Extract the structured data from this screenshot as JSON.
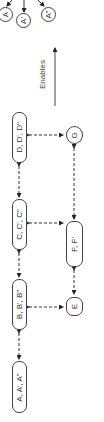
{
  "diagram": {
    "orientation": "rotated-90-ccw",
    "legend": {
      "label": "Enables",
      "arrow": "solid-arrow"
    },
    "top_nodes": [
      {
        "id": "A",
        "label": "A"
      },
      {
        "id": "A1",
        "label": "A'"
      },
      {
        "id": "A2",
        "label": "A\""
      }
    ],
    "main_chain": [
      {
        "id": "D",
        "label": "D, D', D\""
      },
      {
        "id": "C",
        "label": "C, C', C\""
      },
      {
        "id": "B",
        "label": "B, B', B\""
      },
      {
        "id": "Agroup",
        "label": "A, A', A\""
      }
    ],
    "side_nodes": [
      {
        "id": "G",
        "label": "G"
      },
      {
        "id": "F",
        "label": "F, F'"
      },
      {
        "id": "E",
        "label": "E"
      }
    ],
    "edges": [
      {
        "from": "Agroup",
        "to": "B",
        "style": "dashed",
        "bidirectional": true
      },
      {
        "from": "B",
        "to": "C",
        "style": "dashed",
        "bidirectional": true
      },
      {
        "from": "C",
        "to": "D",
        "style": "dashed",
        "bidirectional": true
      },
      {
        "from": "B",
        "to": "E",
        "style": "dashed",
        "bidirectional": true
      },
      {
        "from": "C",
        "to": "F",
        "style": "dashed",
        "bidirectional": true
      },
      {
        "from": "D",
        "to": "G",
        "style": "dashed",
        "bidirectional": true
      },
      {
        "from": "E",
        "to": "F",
        "style": "dashed",
        "bidirectional": true
      },
      {
        "from": "F",
        "to": "G",
        "style": "dashed",
        "bidirectional": true
      },
      {
        "from": "source",
        "to": "A",
        "style": "solid"
      },
      {
        "from": "source",
        "to": "A1",
        "style": "solid"
      },
      {
        "from": "source",
        "to": "A2",
        "style": "solid"
      }
    ],
    "colors": {
      "stroke": "#444444",
      "background": "#ffffff",
      "text": "#333333"
    }
  }
}
